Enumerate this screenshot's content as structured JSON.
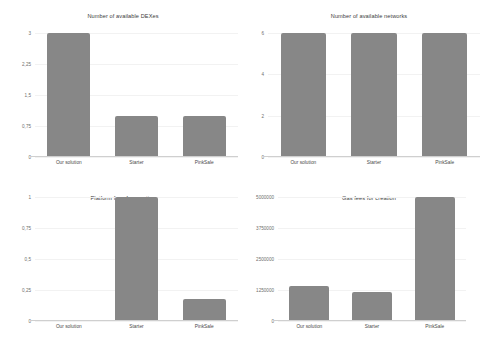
{
  "figure": {
    "background": "#ffffff",
    "bar_color": "#878787",
    "grid_color": "#f2f2f2",
    "axis_color": "#cfcfcf",
    "decimal_separator": ","
  },
  "chart_data": [
    {
      "type": "bar",
      "title": "Number of available DEXes",
      "categories": [
        "Our solution",
        "Starter",
        "PinkSale"
      ],
      "values": [
        3,
        1,
        1
      ],
      "yticks": [
        0,
        0.75,
        1.5,
        2.25,
        3
      ],
      "ytick_labels": [
        "0",
        "0,75",
        "1,5",
        "2,25",
        "3"
      ],
      "ylim": [
        0,
        3
      ],
      "xlabel": "",
      "ylabel": "",
      "grid": true,
      "legend": "none"
    },
    {
      "type": "bar",
      "title": "Number of available networks",
      "categories": [
        "Our solution",
        "Starter",
        "PinkSale"
      ],
      "values": [
        6,
        6,
        6
      ],
      "yticks": [
        0,
        2,
        4,
        6
      ],
      "ytick_labels": [
        "0",
        "2",
        "4",
        "6"
      ],
      "ylim": [
        0,
        6
      ],
      "xlabel": "",
      "ylabel": "",
      "grid": true,
      "legend": "none"
    },
    {
      "type": "bar",
      "title": "Platform fees for creation",
      "categories": [
        "Our solution",
        "Starter",
        "PinkSale"
      ],
      "values": [
        0,
        1,
        0.18
      ],
      "yticks": [
        0,
        0.25,
        0.5,
        0.75,
        1
      ],
      "ytick_labels": [
        "0",
        "0,25",
        "0,5",
        "0,75",
        "1"
      ],
      "ylim": [
        0,
        1
      ],
      "xlabel": "",
      "ylabel": "",
      "grid": true,
      "legend": "none"
    },
    {
      "type": "bar",
      "title": "Gas fees for creation",
      "categories": [
        "Our solution",
        "Starter",
        "PinkSale"
      ],
      "values": [
        1400000,
        1150000,
        5000000
      ],
      "yticks": [
        0,
        1250000,
        2500000,
        3750000,
        5000000
      ],
      "ytick_labels": [
        "0",
        "1250000",
        "2500000",
        "3750000",
        "5000000"
      ],
      "ylim": [
        0,
        5000000
      ],
      "xlabel": "",
      "ylabel": "",
      "grid": true,
      "legend": "none"
    }
  ]
}
